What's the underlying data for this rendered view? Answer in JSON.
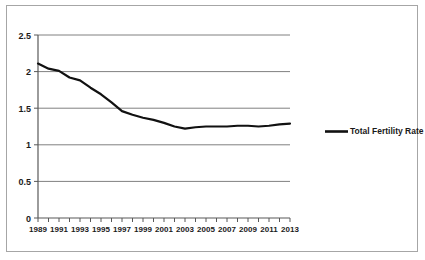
{
  "chart_data": {
    "type": "line",
    "title": "",
    "xlabel": "",
    "ylabel": "",
    "ylim": [
      0,
      2.5
    ],
    "xlim": [
      1989,
      2013
    ],
    "grid": true,
    "legend_position": "right",
    "yticks": [
      "0",
      "0.5",
      "1",
      "1.5",
      "2",
      "2.5"
    ],
    "ytick_values": [
      0,
      0.5,
      1,
      1.5,
      2,
      2.5
    ],
    "xticks": [
      "1989",
      "1991",
      "1993",
      "1995",
      "1997",
      "1999",
      "2001",
      "2003",
      "2005",
      "2007",
      "2009",
      "2011",
      "2013"
    ],
    "x": [
      1989,
      1990,
      1991,
      1992,
      1993,
      1994,
      1995,
      1996,
      1997,
      1998,
      1999,
      2000,
      2001,
      2002,
      2003,
      2004,
      2005,
      2006,
      2007,
      2008,
      2009,
      2010,
      2011,
      2012,
      2013
    ],
    "series": [
      {
        "name": "Total Fertility Rate",
        "color": "#111111",
        "values": [
          2.11,
          2.04,
          2.01,
          1.92,
          1.88,
          1.78,
          1.69,
          1.58,
          1.46,
          1.41,
          1.37,
          1.34,
          1.3,
          1.25,
          1.22,
          1.24,
          1.25,
          1.25,
          1.25,
          1.26,
          1.26,
          1.25,
          1.26,
          1.28,
          1.29
        ]
      }
    ],
    "legend_entries": [
      {
        "label": "Total Fertility Rate",
        "color": "#111111",
        "marker": "line"
      }
    ]
  },
  "colors": {
    "series_line": "#111111",
    "gridline": "#808080",
    "axis": "#595959",
    "border": "#a6a6a6",
    "text": "#1a1a1a",
    "background": "#ffffff"
  }
}
